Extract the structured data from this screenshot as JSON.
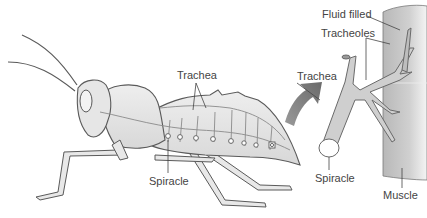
{
  "diagram": {
    "labels": {
      "trachea_body": "Trachea",
      "spiracle_body": "Spiracle",
      "fluid_filled": "Fluid filled",
      "tracheoles": "Tracheoles",
      "trachea_detail": "Trachea",
      "spiracle_detail": "Spiracle",
      "muscle": "Muscle"
    },
    "colors": {
      "body_fill": "#e4e4e4",
      "outline": "#5a5a5a",
      "trachea_fill": "#cfcfcf",
      "muscle_fill": "#c8c8c8",
      "arrow": "#7a7a7a",
      "label_text": "#444444"
    }
  }
}
